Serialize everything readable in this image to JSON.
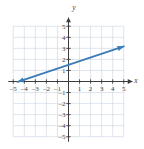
{
  "chart_data": {
    "type": "line",
    "title": "",
    "xlabel": "x",
    "ylabel": "y",
    "xlim": [
      -5,
      5
    ],
    "ylim": [
      -5,
      5
    ],
    "grid": true,
    "grid_color": "#c9d3e0",
    "axis_color": "#3c3c3c",
    "legend": "none",
    "xticks": [
      -5,
      -4,
      -3,
      -2,
      -1,
      1,
      2,
      3,
      4,
      5
    ],
    "yticks": [
      5,
      4,
      3,
      2,
      1,
      -1,
      -2,
      -3,
      -4,
      -5
    ],
    "xtick_labels": [
      "–5",
      "–4",
      "–3",
      "–2",
      "–1",
      "1",
      "2",
      "3",
      "4",
      "5"
    ],
    "ytick_labels": [
      "5",
      "4",
      "3",
      "2",
      "1",
      "–1",
      "–2",
      "–3",
      "–4",
      "–5"
    ],
    "series": [
      {
        "name": "line",
        "color": "#3a7cb8",
        "slope": 0.3333,
        "intercept": 1.5,
        "x_start": -4.6,
        "y_start": -0.03,
        "x_end": 5.0,
        "y_end": 3.17,
        "arrow_start": true,
        "arrow_end": true,
        "points": [
          [
            -4.6,
            -0.03
          ],
          [
            0,
            1.5
          ],
          [
            5.0,
            3.17
          ]
        ]
      }
    ],
    "annotations": []
  },
  "labels": {
    "x_axis": "x",
    "y_axis": "y",
    "x_neg_5": "–5",
    "x_neg_4": "–4",
    "x_neg_3": "–3",
    "x_neg_2": "–2",
    "x_neg_1": "–1",
    "x_pos_1": "1",
    "x_pos_2": "2",
    "x_pos_3": "3",
    "x_pos_4": "4",
    "x_pos_5": "5",
    "y_pos_5": "5",
    "y_pos_4": "4",
    "y_pos_3": "3",
    "y_pos_2": "2",
    "y_pos_1": "1",
    "y_neg_1": "–1",
    "y_neg_2": "–2",
    "y_neg_3": "–3",
    "y_neg_4": "–4",
    "y_neg_5": "–5"
  }
}
